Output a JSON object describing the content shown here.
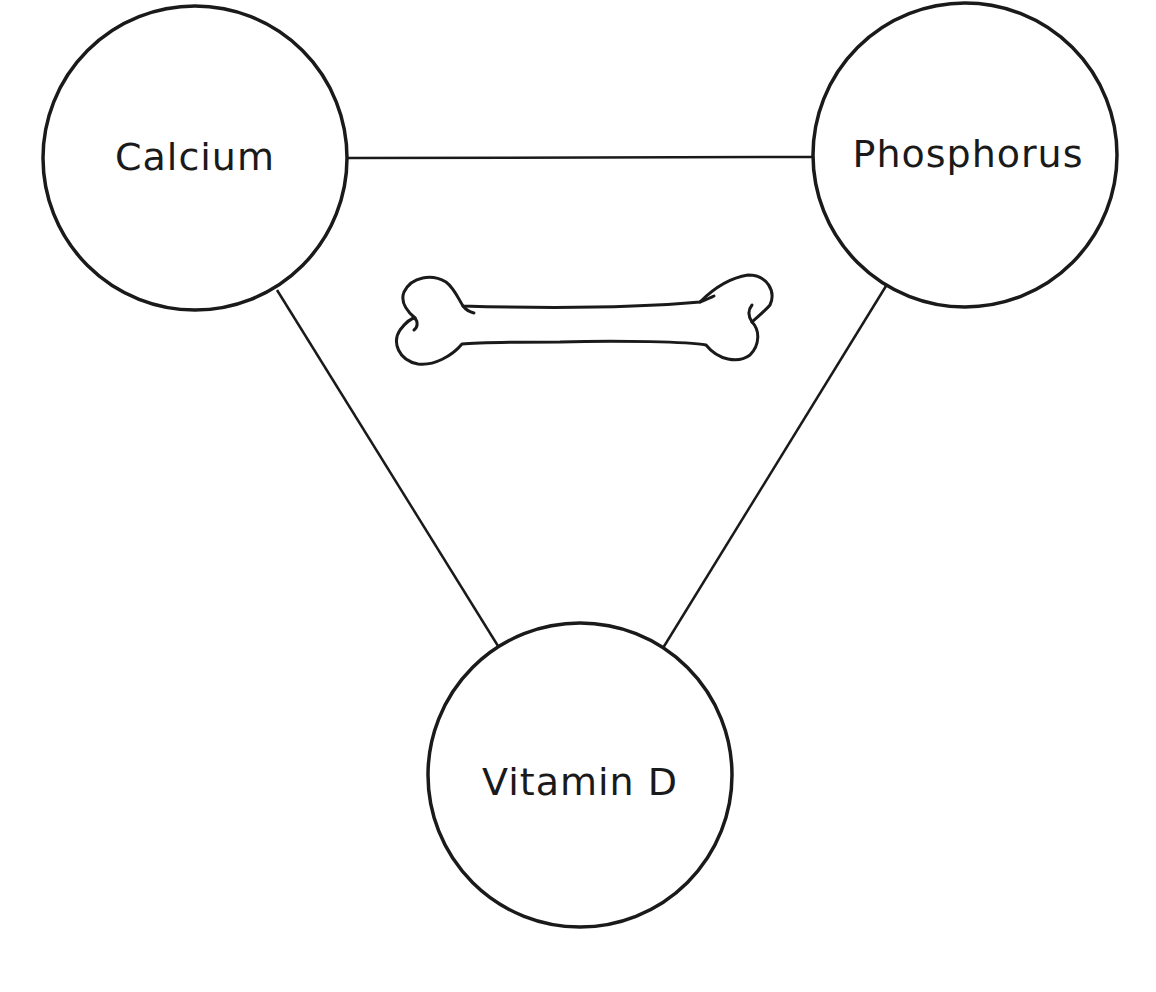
{
  "diagram": {
    "title": "",
    "nodes": [
      {
        "id": "calcium",
        "label": "Calcium",
        "cx": 195,
        "cy": 158,
        "r": 152
      },
      {
        "id": "phosphorus",
        "label": "Phosphorus",
        "cx": 965,
        "cy": 155,
        "r": 152
      },
      {
        "id": "vitamin-d",
        "label": "Vitamin D",
        "cx": 580,
        "cy": 775,
        "r": 152
      }
    ],
    "edges": [
      {
        "from": "calcium",
        "to": "phosphorus"
      },
      {
        "from": "calcium",
        "to": "vitamin-d"
      },
      {
        "from": "phosphorus",
        "to": "vitamin-d"
      }
    ],
    "center_icon": "bone-icon",
    "colors": {
      "stroke": "#1a1a1a",
      "background": "#ffffff"
    }
  }
}
